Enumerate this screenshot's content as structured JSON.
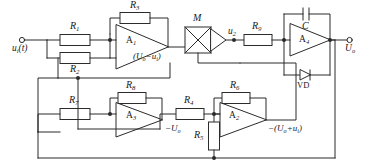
{
  "diagram": {
    "line_color": "#2b2b2b",
    "fill_color": "#ffffff",
    "text_color": "#1a1a1a"
  },
  "terminals": {
    "input": {
      "label_html": "u<sub>i</sub>(t)",
      "x": 22,
      "y": 40
    },
    "output": {
      "label_html": "U<sub>o</sub>",
      "x": 352,
      "y": 40
    }
  },
  "amplifiers": [
    {
      "name": "A1",
      "label_html": "A<sub>1</sub>",
      "output_expr_html": "(U<sub>o</sub>&minus;u<sub>i</sub>)"
    },
    {
      "name": "A2",
      "label_html": "A<sub>2</sub>",
      "output_expr_html": "&minus;(U<sub>o</sub>+u<sub>i</sub>)"
    },
    {
      "name": "A3",
      "label_html": "A<sub>3</sub>",
      "output_expr_html": "&minus;U<sub>o</sub>"
    },
    {
      "name": "A4",
      "label_html": "A<sub>4</sub>",
      "output_expr_html": ""
    }
  ],
  "resistors": [
    {
      "name": "R1",
      "label_html": "R<sub>1</sub>"
    },
    {
      "name": "R2",
      "label_html": "R<sub>2</sub>"
    },
    {
      "name": "R3",
      "label_html": "R<sub>3</sub>"
    },
    {
      "name": "R4",
      "label_html": "R<sub>4</sub>"
    },
    {
      "name": "R5",
      "label_html": "R<sub>5</sub>"
    },
    {
      "name": "R6",
      "label_html": "R<sub>6</sub>"
    },
    {
      "name": "R7",
      "label_html": "R<sub>7</sub>"
    },
    {
      "name": "R8",
      "label_html": "R<sub>8</sub>"
    },
    {
      "name": "R9",
      "label_html": "R<sub>9</sub>"
    }
  ],
  "capacitor": {
    "name": "C",
    "label_html": "C"
  },
  "multiplier": {
    "name": "M",
    "label_html": "M",
    "symbol": "x-cross"
  },
  "diode": {
    "name": "VD",
    "label_html": "VD"
  },
  "nodes": [
    {
      "name": "u2",
      "label_html": "u<sub>2</sub>"
    }
  ]
}
